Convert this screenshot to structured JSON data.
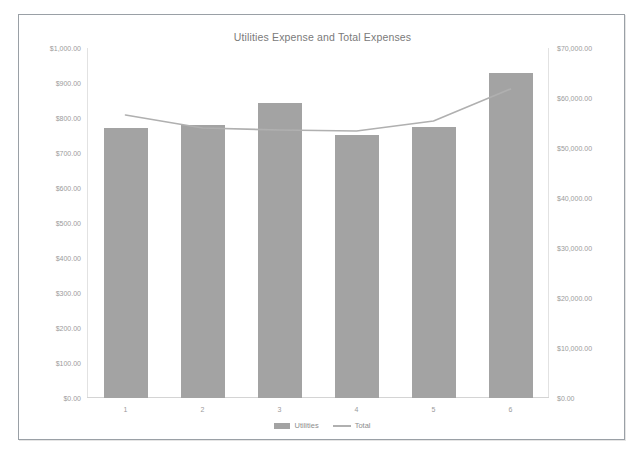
{
  "chart_data": {
    "type": "bar",
    "title": "Utilities Expense and Total Expenses",
    "xlabel": "",
    "ylabel": "",
    "grid": false,
    "legend_position": "bottom",
    "categories": [
      "1",
      "2",
      "3",
      "4",
      "5",
      "6"
    ],
    "series": [
      {
        "name": "Utilities",
        "type": "bar",
        "axis": "left",
        "color": "#a3a3a3",
        "values": [
          771,
          781,
          843,
          751,
          774,
          929
        ]
      },
      {
        "name": "Total",
        "type": "line",
        "axis": "right",
        "color": "#b0b0b0",
        "values": [
          56600,
          54000,
          53600,
          53400,
          55400,
          61800
        ]
      }
    ],
    "left_axis": {
      "ylim": [
        0,
        1000
      ],
      "tick_labels": [
        "$1,000.00",
        "$900.00",
        "$800.00",
        "$700.00",
        "$600.00",
        "$500.00",
        "$400.00",
        "$300.00",
        "$200.00",
        "$100.00",
        "$0.00"
      ],
      "tick_values": [
        1000,
        900,
        800,
        700,
        600,
        500,
        400,
        300,
        200,
        100,
        0
      ]
    },
    "right_axis": {
      "ylim": [
        0,
        70000
      ],
      "tick_labels": [
        "$70,000.00",
        "$60,000.00",
        "$50,000.00",
        "$40,000.00",
        "$30,000.00",
        "$20,000.00",
        "$10,000.00",
        "$0.00"
      ],
      "tick_values": [
        70000,
        60000,
        50000,
        40000,
        30000,
        20000,
        10000,
        0
      ]
    },
    "legend": [
      {
        "label": "Utilities",
        "marker": "bar"
      },
      {
        "label": "Total",
        "marker": "line"
      }
    ]
  }
}
